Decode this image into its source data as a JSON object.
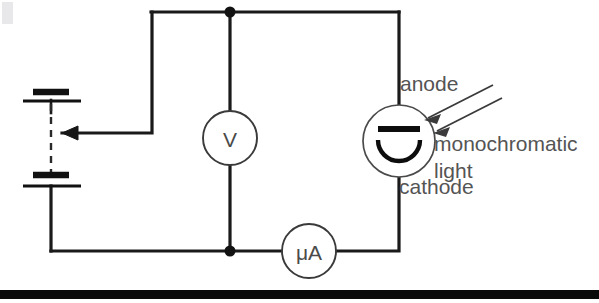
{
  "figure": {
    "background_color": "#ffffff",
    "line_color": "#1a1a1a",
    "text_color": "#545454",
    "width": 599,
    "height": 303
  },
  "labels": {
    "anode": "anode",
    "cathode": "cathode",
    "light_line1": "monochromatic",
    "light_line2": "light"
  },
  "meters": {
    "voltmeter": "V",
    "microammeter": "μA"
  },
  "components": {
    "battery_name": "variable-dc-source",
    "phototube_name": "phototube",
    "slider_name": "potentiometer-tap-arrow",
    "ray_name": "incident-light-rays"
  }
}
